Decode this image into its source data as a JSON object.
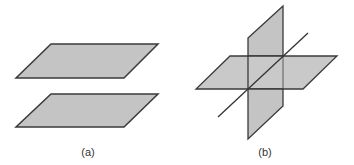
{
  "figure": {
    "colors": {
      "plane_fill": "#c4c4c4",
      "edge": "#3a3a3a",
      "line": "#333333",
      "label": "#333333"
    },
    "panels": [
      {
        "id": "a",
        "label": "(a)",
        "description": "Two parallel horizontal planes",
        "planes": [
          {
            "name": "upper-plane",
            "points": "51,44 158,44 124,78 16,78"
          },
          {
            "name": "lower-plane",
            "points": "51,94 158,94 124,127 16,127"
          }
        ]
      },
      {
        "id": "b",
        "label": "(b)",
        "description": "Two intersecting planes meeting along a line",
        "planes": [
          {
            "name": "horizontal-plane",
            "points": "230,56 337,56 303,89 196,89"
          },
          {
            "name": "vertical-plane",
            "points": "248,38 283,6 283,106 248,139"
          }
        ],
        "line": {
          "name": "intersection-line",
          "x1": 218,
          "y1": 117,
          "x2": 308,
          "y2": 33
        }
      }
    ]
  }
}
